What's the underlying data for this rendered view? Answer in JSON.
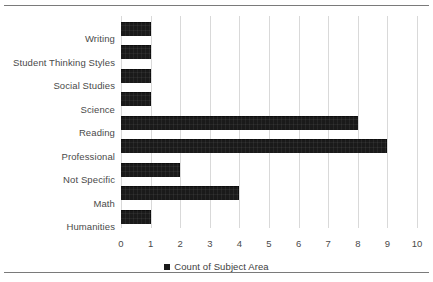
{
  "page": {
    "top_rule": "horizontal-rule",
    "bottom_rule": "horizontal-rule"
  },
  "legend": {
    "marker": "black-square-marker",
    "label": "Count of Subject Area",
    "position": "bottom-center"
  },
  "chart_data": {
    "type": "bar",
    "orientation": "horizontal",
    "title": "",
    "subtitle": "",
    "xlabel": "",
    "ylabel": "",
    "xlim": [
      0,
      10
    ],
    "xticks": [
      "0",
      "1",
      "2",
      "3",
      "4",
      "5",
      "6",
      "7",
      "8",
      "9",
      "10"
    ],
    "grid": "vertical",
    "legend_entries": [
      "Count of Subject Area"
    ],
    "series_color": "#1a1a1a",
    "categories": [
      "Writing",
      "Student Thinking Styles",
      "Social Studies",
      "Science",
      "Reading",
      "Professional",
      "Not Specific",
      "Math",
      "Humanities"
    ],
    "values": [
      1,
      1,
      1,
      1,
      8,
      9,
      2,
      4,
      1
    ],
    "series": [
      {
        "name": "Count of Subject Area",
        "values": [
          1,
          1,
          1,
          1,
          8,
          9,
          2,
          4,
          1
        ]
      }
    ]
  }
}
